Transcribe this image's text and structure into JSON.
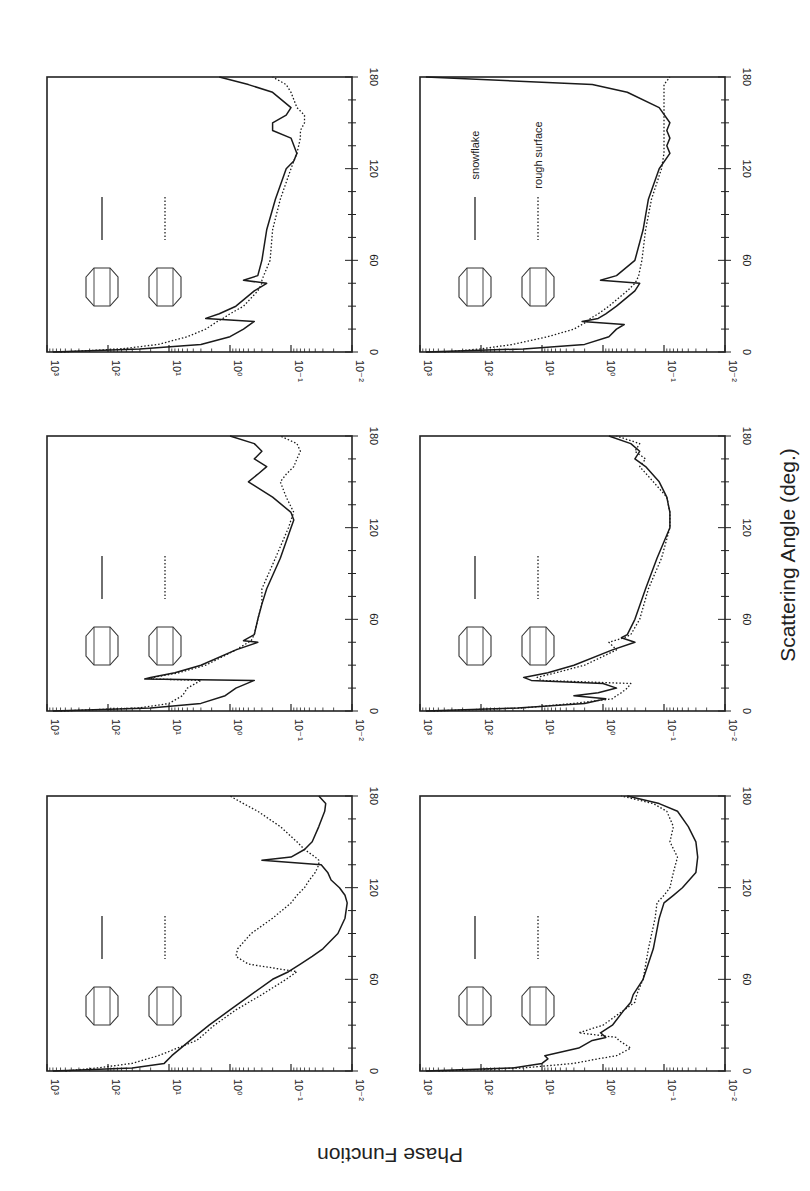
{
  "figure": {
    "xlabel": "Scattering Angle (deg.)",
    "ylabel": "Phase Function",
    "orientation": "rotated 90deg counter-clockwise"
  },
  "chart_data": {
    "type": "line",
    "layout": "3x2 panel grid (log y-axis), figure rotated 90° CCW",
    "xlabel": "Scattering Angle (deg.)",
    "ylabel": "Phase Function",
    "xlim": [
      0,
      180
    ],
    "ylim": [
      0.01,
      1000
    ],
    "yscale": "log",
    "x_ticks": [
      0,
      60,
      120,
      180
    ],
    "y_ticks": [
      "10^-2",
      "10^-1",
      "10^0",
      "10^1",
      "10^2",
      "10^3"
    ],
    "grid": false,
    "panels": [
      {
        "id": "sphere-spheroid",
        "legend": [
          {
            "style": "solid",
            "icon": "sphere-icon",
            "label": ""
          },
          {
            "style": "dotted",
            "icon": "spheroid-icon",
            "label": ""
          }
        ],
        "x": [
          0,
          2,
          5,
          10,
          20,
          30,
          40,
          50,
          60,
          65,
          70,
          75,
          80,
          90,
          100,
          110,
          115,
          120,
          125,
          130,
          135,
          138,
          140,
          145,
          150,
          160,
          170,
          175,
          180
        ],
        "series": [
          {
            "name": "sphere (solid)",
            "values": [
              800,
              40,
              12,
              9,
              4.5,
              2.2,
              1.0,
              0.45,
              0.2,
              0.11,
              0.07,
              0.045,
              0.03,
              0.017,
              0.013,
              0.012,
              0.013,
              0.016,
              0.022,
              0.025,
              0.032,
              0.3,
              0.1,
              0.06,
              0.045,
              0.035,
              0.028,
              0.027,
              0.035
            ]
          },
          {
            "name": "spheroid (dotted)",
            "values": [
              500,
              150,
              40,
              15,
              3.5,
              1.8,
              0.8,
              0.3,
              0.12,
              0.08,
              0.5,
              0.8,
              0.75,
              0.45,
              0.2,
              0.1,
              0.08,
              0.06,
              0.05,
              0.04,
              0.035,
              0.035,
              0.04,
              0.06,
              0.08,
              0.15,
              0.35,
              0.6,
              1.0
            ]
          }
        ]
      },
      {
        "id": "column-hollow-column",
        "legend": [
          {
            "style": "solid",
            "icon": "hexagonal-column-icon",
            "label": ""
          },
          {
            "style": "dotted",
            "icon": "hollow-column-icon",
            "label": ""
          }
        ],
        "x": [
          0,
          2,
          5,
          10,
          15,
          20,
          21,
          22,
          25,
          30,
          40,
          45,
          46,
          50,
          60,
          70,
          80,
          100,
          120,
          125,
          130,
          140,
          150,
          155,
          160,
          165,
          170,
          175,
          180
        ],
        "series": [
          {
            "name": "hexagonal column (solid)",
            "values": [
              800,
              20,
              3,
              1.2,
              0.8,
              0.4,
              25,
              20,
              8,
              3,
              0.8,
              0.35,
              0.6,
              0.4,
              0.35,
              0.3,
              0.25,
              0.15,
              0.1,
              0.09,
              0.1,
              0.2,
              0.5,
              0.35,
              0.25,
              0.4,
              0.3,
              0.4,
              1.0
            ]
          },
          {
            "name": "hollow column (dotted)",
            "values": [
              600,
              30,
              10,
              6,
              5,
              3,
              20,
              18,
              7,
              2.5,
              0.8,
              0.5,
              0.45,
              0.4,
              0.35,
              0.3,
              0.3,
              0.18,
              0.11,
              0.1,
              0.09,
              0.12,
              0.15,
              0.12,
              0.09,
              0.08,
              0.07,
              0.08,
              0.15
            ]
          }
        ]
      },
      {
        "id": "plate-snowflake",
        "legend": [
          {
            "style": "solid",
            "icon": "hexagonal-plate-icon",
            "label": ""
          },
          {
            "style": "dotted",
            "icon": "snowflake-icon",
            "label": ""
          }
        ],
        "x": [
          0,
          2,
          5,
          10,
          15,
          20,
          22,
          25,
          30,
          40,
          45,
          47,
          50,
          60,
          80,
          100,
          120,
          125,
          130,
          140,
          145,
          150,
          155,
          160,
          170,
          175,
          180
        ],
        "series": [
          {
            "name": "hexagonal plate (solid)",
            "values": [
              800,
              30,
              3,
              1.0,
              0.6,
              0.4,
              2.5,
              1.5,
              0.8,
              0.4,
              0.25,
              0.6,
              0.35,
              0.3,
              0.25,
              0.18,
              0.12,
              0.09,
              0.08,
              0.1,
              0.2,
              0.2,
              0.12,
              0.1,
              0.2,
              0.5,
              1.5
            ]
          },
          {
            "name": "snowflake (dotted)",
            "values": [
              600,
              60,
              15,
              5,
              2.5,
              1.6,
              1.3,
              1.0,
              0.6,
              0.35,
              0.3,
              0.3,
              0.28,
              0.22,
              0.2,
              0.15,
              0.1,
              0.09,
              0.08,
              0.07,
              0.07,
              0.06,
              0.06,
              0.08,
              0.1,
              0.12,
              0.2
            ]
          }
        ]
      },
      {
        "id": "spatial-column-columns",
        "legend": [
          {
            "style": "solid",
            "icon": "capped-column-icon",
            "label": ""
          },
          {
            "style": "dotted",
            "icon": "column-ring-icon",
            "label": ""
          }
        ],
        "x": [
          0,
          2,
          5,
          8,
          10,
          15,
          20,
          22,
          25,
          30,
          40,
          45,
          50,
          60,
          80,
          100,
          110,
          115,
          120,
          130,
          140,
          150,
          160,
          170,
          175,
          180
        ],
        "series": [
          {
            "name": "solid curve",
            "values": [
              800,
              30,
              10,
              8,
              9,
              2.5,
              1.5,
              0.9,
              1.1,
              0.7,
              0.45,
              0.35,
              0.32,
              0.22,
              0.15,
              0.12,
              0.1,
              0.07,
              0.05,
              0.03,
              0.028,
              0.03,
              0.04,
              0.06,
              0.12,
              0.4
            ]
          },
          {
            "name": "dotted curve",
            "values": [
              500,
              20,
              3,
              1.2,
              0.6,
              0.35,
              0.55,
              0.6,
              2.5,
              1.0,
              0.45,
              0.3,
              0.28,
              0.22,
              0.18,
              0.14,
              0.13,
              0.1,
              0.08,
              0.07,
              0.06,
              0.08,
              0.07,
              0.09,
              0.15,
              0.5
            ]
          }
        ]
      },
      {
        "id": "bullet-rosette-aggregate",
        "legend": [
          {
            "style": "solid",
            "icon": "bullet-rosette-icon",
            "label": ""
          },
          {
            "style": "dotted",
            "icon": "aggregate-icon",
            "label": ""
          }
        ],
        "x": [
          0,
          2,
          5,
          8,
          10,
          12,
          15,
          18,
          20,
          22,
          25,
          30,
          40,
          45,
          48,
          50,
          60,
          80,
          100,
          120,
          130,
          140,
          150,
          160,
          165,
          170,
          175,
          180
        ],
        "series": [
          {
            "name": "bullet rosette (solid)",
            "values": [
              800,
              25,
              2,
              0.9,
              3,
              1.2,
              0.6,
              1.0,
              15,
              20,
              8,
              3,
              0.7,
              0.3,
              0.5,
              0.4,
              0.3,
              0.2,
              0.13,
              0.08,
              0.08,
              0.09,
              0.12,
              0.2,
              0.3,
              0.25,
              0.35,
              0.8
            ]
          },
          {
            "name": "aggregate (dotted)",
            "values": [
              600,
              20,
              3,
              0.7,
              0.6,
              0.5,
              0.4,
              0.35,
              10,
              12,
              6,
              2,
              0.6,
              0.8,
              0.45,
              0.35,
              0.25,
              0.18,
              0.11,
              0.08,
              0.08,
              0.09,
              0.15,
              0.25,
              0.2,
              0.3,
              0.25,
              0.6
            ]
          }
        ]
      },
      {
        "id": "snowflake-rough-surface",
        "legend": [
          {
            "style": "solid",
            "icon": "rough-snowflake-icon",
            "label": "snowflake"
          },
          {
            "style": "dotted",
            "icon": "rough-column-icon",
            "label": "rough surface"
          }
        ],
        "x": [
          0,
          2,
          5,
          10,
          15,
          18,
          20,
          22,
          25,
          30,
          40,
          45,
          47,
          50,
          60,
          80,
          100,
          120,
          130,
          135,
          140,
          145,
          150,
          160,
          170,
          175,
          180
        ],
        "series": [
          {
            "name": "snowflake (solid)",
            "values": [
              800,
              20,
              2,
              0.8,
              0.6,
              0.45,
              2.2,
              1.2,
              0.9,
              0.6,
              0.3,
              0.25,
              1.1,
              0.6,
              0.3,
              0.22,
              0.18,
              0.12,
              0.08,
              0.09,
              0.08,
              0.09,
              0.08,
              0.12,
              0.4,
              1.5,
              800
            ]
          },
          {
            "name": "rough surface (dotted)",
            "values": [
              400,
              100,
              30,
              8,
              3,
              2.2,
              1.8,
              1.6,
              1.2,
              0.8,
              0.4,
              0.3,
              0.28,
              0.26,
              0.23,
              0.2,
              0.16,
              0.11,
              0.1,
              0.1,
              0.1,
              0.1,
              0.1,
              0.1,
              0.1,
              0.1,
              0.08
            ]
          }
        ]
      }
    ]
  }
}
